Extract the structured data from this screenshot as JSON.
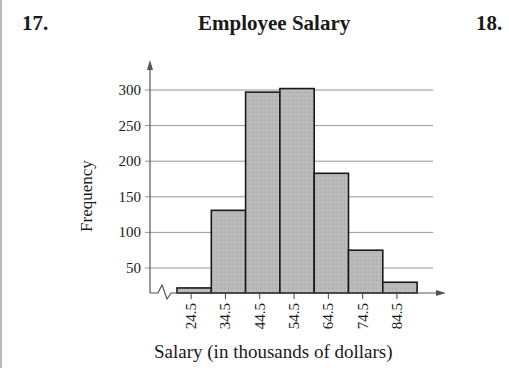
{
  "exercise_left": "17.",
  "exercise_right": "18.",
  "chart_data": {
    "type": "bar",
    "subtype": "histogram",
    "title": "Employee Salary",
    "xlabel": "Salary (in thousands of dollars)",
    "ylabel": "Frequency",
    "categories": [
      "24.5",
      "34.5",
      "44.5",
      "54.5",
      "64.5",
      "74.5",
      "84.5"
    ],
    "values": [
      22,
      131,
      297,
      302,
      183,
      75,
      30
    ],
    "yticks": [
      50,
      100,
      150,
      200,
      250,
      300
    ],
    "ytick_labels": [
      "50",
      "100",
      "150",
      "200",
      "250",
      "300"
    ],
    "ylim": [
      15,
      310
    ],
    "y_axis_break": true,
    "grid": "horizontal",
    "legend": "none",
    "bar_color": "#b8b8b8",
    "bar_edge_color": "#1a1a1a"
  }
}
